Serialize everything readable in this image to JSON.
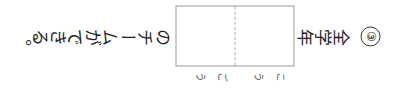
{
  "question": {
    "number": "③",
    "label": "全学年",
    "answer_box": {
      "cells": 2,
      "furigana": [
        "こう",
        "ごう"
      ]
    },
    "continuation": "のチームができる。"
  },
  "colors": {
    "text": "#222222",
    "box_border": "#999999",
    "divider": "#aaaaaa"
  }
}
